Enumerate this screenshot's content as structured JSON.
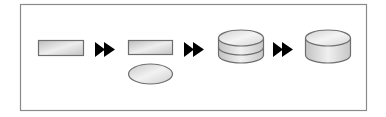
{
  "diagram": {
    "type": "process-flow",
    "colors": {
      "frame": "#8a8a8a",
      "shape_stroke": "#6e6e6e",
      "fill_light": "#f2f2f2",
      "fill_dark": "#bdbdbd",
      "arrow": "#000000"
    },
    "steps": [
      {
        "shape": "rectangle",
        "label": ""
      },
      {
        "shape": "rectangle+ellipse",
        "label": ""
      },
      {
        "shape": "cylinder-split",
        "label": ""
      },
      {
        "shape": "cylinder",
        "label": ""
      }
    ],
    "connectors": [
      {
        "icon": "double-arrow-right-icon"
      },
      {
        "icon": "double-arrow-right-icon"
      },
      {
        "icon": "double-arrow-right-icon"
      }
    ]
  }
}
